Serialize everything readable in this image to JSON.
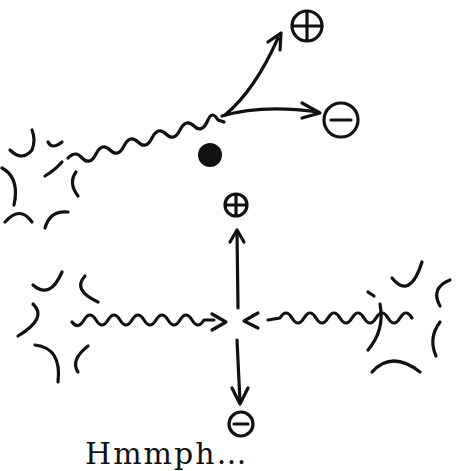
{
  "diagram": {
    "top_panel": {
      "description": "photon from burst source scattering near nucleus, splitting into positive and negative particles",
      "labels": {
        "positive": "+",
        "negative": "−"
      },
      "nucleus": "dense dot"
    },
    "middle_label": {
      "positive": "+"
    },
    "bottom_panel": {
      "description": "two photons from opposite bursts colliding, producing positive (up) and negative (down) particles",
      "labels": {
        "negative": "−"
      }
    },
    "caption": "Hmmph…"
  },
  "colors": {
    "ink": "#111111",
    "background": "#ffffff"
  }
}
